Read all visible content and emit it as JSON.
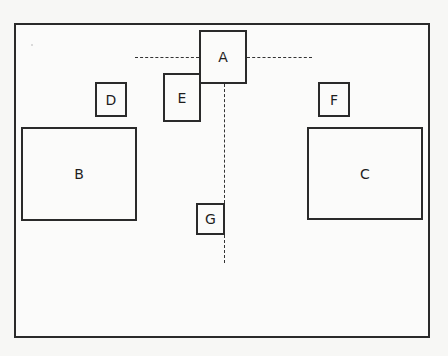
{
  "diagram": {
    "title": "",
    "frame": {
      "x": 14,
      "y": 23,
      "w": 416,
      "h": 315
    },
    "boxes": [
      {
        "id": "A",
        "label": "A",
        "x": 199,
        "y": 30,
        "w": 48,
        "h": 54
      },
      {
        "id": "B",
        "label": "B",
        "x": 21,
        "y": 127,
        "w": 116,
        "h": 94
      },
      {
        "id": "C",
        "label": "C",
        "x": 307,
        "y": 127,
        "w": 116,
        "h": 93
      },
      {
        "id": "D",
        "label": "D",
        "x": 95,
        "y": 82,
        "w": 32,
        "h": 35
      },
      {
        "id": "E",
        "label": "E",
        "x": 163,
        "y": 73,
        "w": 38,
        "h": 49
      },
      {
        "id": "F",
        "label": "F",
        "x": 318,
        "y": 82,
        "w": 32,
        "h": 35
      },
      {
        "id": "G",
        "label": "G",
        "x": 196,
        "y": 203,
        "w": 29,
        "h": 32
      }
    ],
    "dashed_lines": [
      {
        "id": "h-left",
        "orientation": "horizontal",
        "x1": 135,
        "x2": 199,
        "y": 57
      },
      {
        "id": "h-right",
        "orientation": "horizontal",
        "x1": 247,
        "x2": 312,
        "y": 57
      },
      {
        "id": "v-upper",
        "orientation": "vertical",
        "x": 224,
        "y1": 84,
        "y2": 203
      },
      {
        "id": "v-lower",
        "orientation": "vertical",
        "x": 224,
        "y1": 235,
        "y2": 263
      }
    ]
  }
}
